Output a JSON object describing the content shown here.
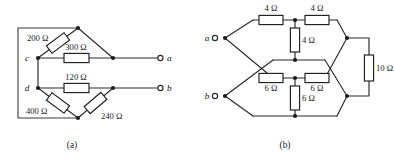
{
  "figure": {
    "background": "#ffffff",
    "wire_color": "#2a2a2a",
    "label_color": "#1a1a1a",
    "resistor_fill": "#ffffff"
  },
  "panels": [
    {
      "id": "a",
      "caption": "(a)",
      "terminals": [
        {
          "name": "a",
          "label": "a"
        },
        {
          "name": "b",
          "label": "b"
        }
      ],
      "nodes": [
        {
          "name": "c",
          "label": "c"
        },
        {
          "name": "d",
          "label": "d"
        }
      ],
      "resistors": [
        {
          "name": "r200",
          "label": "200 Ω",
          "value": 200,
          "unit": "Ω",
          "orientation": "diagonal"
        },
        {
          "name": "r300",
          "label": "300 Ω",
          "value": 300,
          "unit": "Ω",
          "orientation": "horizontal"
        },
        {
          "name": "r120",
          "label": "120 Ω",
          "value": 120,
          "unit": "Ω",
          "orientation": "horizontal"
        },
        {
          "name": "r400",
          "label": "400 Ω",
          "value": 400,
          "unit": "Ω",
          "orientation": "diagonal"
        },
        {
          "name": "r240",
          "label": "240 Ω",
          "value": 240,
          "unit": "Ω",
          "orientation": "diagonal"
        }
      ]
    },
    {
      "id": "b",
      "caption": "(b)",
      "terminals": [
        {
          "name": "a",
          "label": "a"
        },
        {
          "name": "b",
          "label": "b"
        }
      ],
      "nodes": [],
      "resistors": [
        {
          "name": "r4-top-left",
          "label": "4 Ω",
          "value": 4,
          "unit": "Ω",
          "orientation": "horizontal"
        },
        {
          "name": "r4-top-right",
          "label": "4 Ω",
          "value": 4,
          "unit": "Ω",
          "orientation": "horizontal"
        },
        {
          "name": "r4-mid",
          "label": "4 Ω",
          "value": 4,
          "unit": "Ω",
          "orientation": "vertical"
        },
        {
          "name": "r6-left",
          "label": "6 Ω",
          "value": 6,
          "unit": "Ω",
          "orientation": "horizontal"
        },
        {
          "name": "r6-right",
          "label": "6 Ω",
          "value": 6,
          "unit": "Ω",
          "orientation": "horizontal"
        },
        {
          "name": "r6-mid",
          "label": "6 Ω",
          "value": 6,
          "unit": "Ω",
          "orientation": "vertical"
        },
        {
          "name": "r10",
          "label": "10 Ω",
          "value": 10,
          "unit": "Ω",
          "orientation": "vertical"
        }
      ]
    }
  ]
}
